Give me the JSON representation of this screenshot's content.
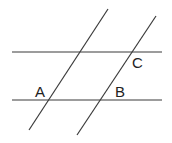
{
  "diagram": {
    "line_color": "#3a3a3a",
    "labels": {
      "A": "A",
      "B": "B",
      "C": "C"
    },
    "lines": [
      {
        "name": "upper-horizontal",
        "x1": 12,
        "y1": 52,
        "x2": 162,
        "y2": 52
      },
      {
        "name": "lower-horizontal",
        "x1": 12,
        "y1": 100,
        "x2": 162,
        "y2": 100
      },
      {
        "name": "left-transversal",
        "x1": 108,
        "y1": 9,
        "x2": 29,
        "y2": 130
      },
      {
        "name": "right-transversal",
        "x1": 156,
        "y1": 16,
        "x2": 77,
        "y2": 135
      }
    ]
  }
}
